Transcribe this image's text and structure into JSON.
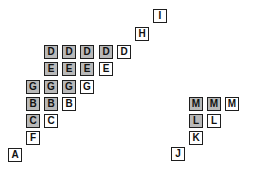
{
  "diagram": {
    "box_size": 15,
    "colors": {
      "filled": "#b9b9b9",
      "empty": "#ffffff",
      "border": "#1e1e1e"
    },
    "boxes": [
      {
        "label": "I",
        "x": 153,
        "y": 9,
        "filled": false
      },
      {
        "label": "H",
        "x": 135,
        "y": 27,
        "filled": false
      },
      {
        "label": "D",
        "x": 44,
        "y": 45,
        "filled": true
      },
      {
        "label": "D",
        "x": 62,
        "y": 45,
        "filled": true
      },
      {
        "label": "D",
        "x": 80,
        "y": 45,
        "filled": true
      },
      {
        "label": "D",
        "x": 99,
        "y": 45,
        "filled": true
      },
      {
        "label": "D",
        "x": 117,
        "y": 45,
        "filled": false
      },
      {
        "label": "E",
        "x": 44,
        "y": 62,
        "filled": true
      },
      {
        "label": "E",
        "x": 62,
        "y": 62,
        "filled": true
      },
      {
        "label": "E",
        "x": 80,
        "y": 62,
        "filled": true
      },
      {
        "label": "E",
        "x": 99,
        "y": 62,
        "filled": false
      },
      {
        "label": "G",
        "x": 26,
        "y": 80,
        "filled": true
      },
      {
        "label": "G",
        "x": 44,
        "y": 80,
        "filled": true
      },
      {
        "label": "G",
        "x": 62,
        "y": 80,
        "filled": true
      },
      {
        "label": "G",
        "x": 80,
        "y": 80,
        "filled": false
      },
      {
        "label": "B",
        "x": 26,
        "y": 97,
        "filled": true
      },
      {
        "label": "B",
        "x": 44,
        "y": 97,
        "filled": true
      },
      {
        "label": "B",
        "x": 62,
        "y": 97,
        "filled": false
      },
      {
        "label": "C",
        "x": 26,
        "y": 114,
        "filled": true
      },
      {
        "label": "C",
        "x": 44,
        "y": 114,
        "filled": false
      },
      {
        "label": "F",
        "x": 26,
        "y": 131,
        "filled": false
      },
      {
        "label": "A",
        "x": 8,
        "y": 148,
        "filled": false
      },
      {
        "label": "M",
        "x": 189,
        "y": 97,
        "filled": true
      },
      {
        "label": "M",
        "x": 207,
        "y": 97,
        "filled": true
      },
      {
        "label": "M",
        "x": 225,
        "y": 97,
        "filled": false
      },
      {
        "label": "L",
        "x": 189,
        "y": 114,
        "filled": true
      },
      {
        "label": "L",
        "x": 207,
        "y": 114,
        "filled": false
      },
      {
        "label": "K",
        "x": 189,
        "y": 131,
        "filled": false
      },
      {
        "label": "J",
        "x": 171,
        "y": 147,
        "filled": false
      }
    ]
  }
}
